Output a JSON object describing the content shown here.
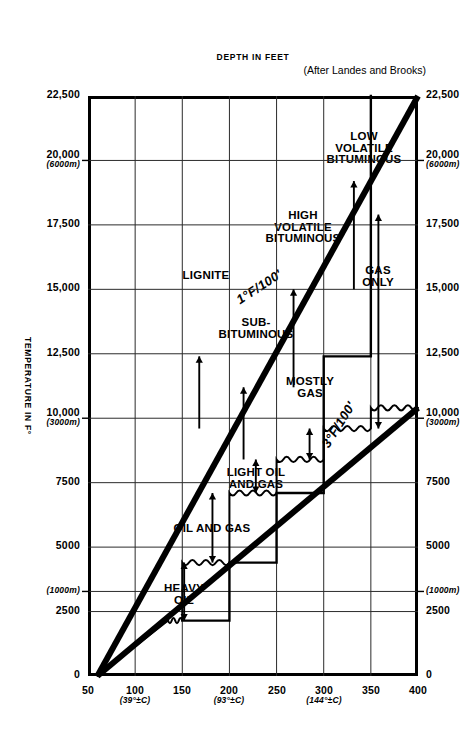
{
  "figure": {
    "credit": "(After Landes and Brooks)",
    "x_axis_title": "TEMPERATURE IN F°",
    "y_axis_title": "DEPTH IN FEET"
  },
  "chart_data": {
    "type": "line",
    "subtitle": "(After Landes and Brooks)",
    "xlabel": "TEMPERATURE IN F°",
    "ylabel": "DEPTH IN FEET",
    "xlim": [
      50,
      400
    ],
    "ylim": [
      0,
      22500
    ],
    "grid": true,
    "legend_position": "none",
    "x_ticks": [
      {
        "value": 50,
        "label": "50",
        "sub": ""
      },
      {
        "value": 100,
        "label": "100",
        "sub": "(39°±C)"
      },
      {
        "value": 150,
        "label": "150",
        "sub": ""
      },
      {
        "value": 200,
        "label": "200",
        "sub": "(93°±C)"
      },
      {
        "value": 250,
        "label": "250",
        "sub": ""
      },
      {
        "value": 300,
        "label": "300",
        "sub": "(144°±C)"
      },
      {
        "value": 350,
        "label": "350",
        "sub": ""
      },
      {
        "value": 400,
        "label": "400",
        "sub": ""
      }
    ],
    "y_ticks": [
      {
        "value": 0,
        "label": "0",
        "sub": ""
      },
      {
        "value": 2500,
        "label": "2500",
        "sub": ""
      },
      {
        "value": 3280,
        "label": "",
        "sub": "(1000m)"
      },
      {
        "value": 5000,
        "label": "5000",
        "sub": ""
      },
      {
        "value": 7500,
        "label": "7500",
        "sub": ""
      },
      {
        "value": 10000,
        "label": "10,000",
        "sub": "(3000m)"
      },
      {
        "value": 12500,
        "label": "12,500",
        "sub": ""
      },
      {
        "value": 15000,
        "label": "15,000",
        "sub": ""
      },
      {
        "value": 17500,
        "label": "17,500",
        "sub": ""
      },
      {
        "value": 20000,
        "label": "20,000",
        "sub": "(6000m)"
      },
      {
        "value": 22500,
        "label": "22,500",
        "sub": ""
      }
    ],
    "series": [
      {
        "name": "1°F/100'",
        "kind": "geothermal-gradient",
        "label": "1°F/100'",
        "points": [
          [
            60,
            0
          ],
          [
            400,
            22500
          ]
        ]
      },
      {
        "name": "3°F/100'",
        "kind": "geothermal-gradient",
        "label": "3°F/100'",
        "points": [
          [
            60,
            0
          ],
          [
            400,
            10400
          ]
        ]
      },
      {
        "name": "hydrocarbon-window-boundary",
        "kind": "wavy-step",
        "points": [
          [
            60,
            0
          ],
          [
            135,
            2150
          ],
          [
            150,
            2150
          ],
          [
            150,
            4400
          ],
          [
            200,
            4400
          ],
          [
            200,
            7100
          ],
          [
            250,
            7100
          ],
          [
            250,
            8400
          ],
          [
            300,
            8400
          ],
          [
            300,
            9600
          ],
          [
            350,
            9600
          ],
          [
            350,
            10400
          ],
          [
            400,
            10400
          ]
        ]
      },
      {
        "name": "coal-rank-step-boundary",
        "kind": "step",
        "points": [
          [
            150,
            2150
          ],
          [
            200,
            4400
          ],
          [
            250,
            7100
          ],
          [
            300,
            12400
          ],
          [
            350,
            17900
          ],
          [
            350,
            22500
          ]
        ]
      }
    ],
    "coal_rank_labels": [
      {
        "text": "LIGNITE",
        "temp": 175,
        "depth": 15500
      },
      {
        "text": "SUB-\nBITUMINOUS",
        "temp": 228,
        "depth": 13500
      },
      {
        "text": "HIGH\nVOLATILE\nBITUMINOUS",
        "temp": 278,
        "depth": 17400
      },
      {
        "text": "LOW\nVOLATILE\nBITUMINOUS",
        "temp": 343,
        "depth": 20500
      }
    ],
    "hydrocarbon_labels": [
      {
        "text": "HEAVY\nOIL",
        "temp": 152,
        "depth": 3200
      },
      {
        "text": "OIL AND GAS",
        "temp": 182,
        "depth": 5700
      },
      {
        "text": "LIGHT OIL\nAND GAS",
        "temp": 228,
        "depth": 7700
      },
      {
        "text": "MOSTLY\nGAS",
        "temp": 285,
        "depth": 11200
      },
      {
        "text": "GAS\nONLY",
        "temp": 358,
        "depth": 15500
      }
    ],
    "annotations": [
      "1°F/100'",
      "3°F/100'",
      "(After Landes and Brooks)"
    ]
  },
  "labels": {
    "credit": "(After Landes and Brooks)",
    "depth_axis": "DEPTH IN FEET",
    "temp_axis": "TEMPERATURE IN F°",
    "grad_low": "1°F/100'",
    "grad_high": "3°F/100'",
    "lignite": "LIGNITE",
    "subbituminous": "SUB-\nBITUMINOUS",
    "high_volatile": "HIGH\nVOLATILE\nBITUMINOUS",
    "low_volatile": "LOW\nVOLATILE\nBITUMINOUS",
    "heavy_oil": "HEAVY\nOIL",
    "oil_and_gas": "OIL AND GAS",
    "light_oil_and_gas": "LIGHT OIL\nAND GAS",
    "mostly_gas": "MOSTLY\nGAS",
    "gas_only": "GAS\nONLY"
  }
}
